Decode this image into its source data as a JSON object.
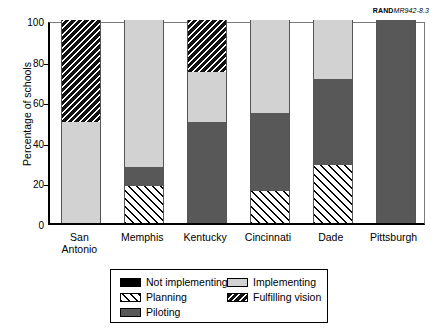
{
  "source_tag": {
    "bold_part": "RAND",
    "italic_part": "MR942-8.3"
  },
  "chart_data": {
    "type": "bar",
    "subtype": "stacked-bar-100",
    "title": "",
    "xlabel": "",
    "ylabel": "Percentage of schools",
    "ylim": [
      0,
      100
    ],
    "yticks": [
      0,
      20,
      40,
      60,
      80,
      100
    ],
    "grid": false,
    "legend_position": "bottom",
    "categories": [
      "San\nAntonio",
      "Memphis",
      "Kentucky",
      "Cincinnati",
      "Dade",
      "Pittsburgh"
    ],
    "series": [
      {
        "name": "Not implementing",
        "fill": "fill-not-implementing",
        "color": "#000000",
        "values": [
          0,
          0,
          0,
          0,
          0,
          0
        ]
      },
      {
        "name": "Planning",
        "fill": "fill-planning",
        "color": "#ffffff",
        "values": [
          0,
          18,
          0,
          16,
          28.5,
          0
        ]
      },
      {
        "name": "Piloting",
        "fill": "fill-piloting",
        "color": "#585858",
        "values": [
          0,
          9.5,
          50,
          38,
          42.5,
          100
        ]
      },
      {
        "name": "Implementing",
        "fill": "fill-implementing",
        "color": "#d2d2d2",
        "values": [
          50,
          72.5,
          24.5,
          46,
          29,
          0
        ]
      },
      {
        "name": "Fulfilling vision",
        "fill": "fill-fulfilling",
        "color": "#111111",
        "values": [
          50,
          0,
          25.5,
          0,
          0,
          0
        ]
      }
    ]
  },
  "legend": {
    "left_column": [
      {
        "label": "Not implementing",
        "fill": "fill-not-implementing"
      },
      {
        "label": "Planning",
        "fill": "fill-planning"
      },
      {
        "label": "Piloting",
        "fill": "fill-piloting"
      }
    ],
    "right_column": [
      {
        "label": "Implementing",
        "fill": "fill-implementing"
      },
      {
        "label": "Fulfilling vision",
        "fill": "fill-fulfilling"
      }
    ]
  }
}
